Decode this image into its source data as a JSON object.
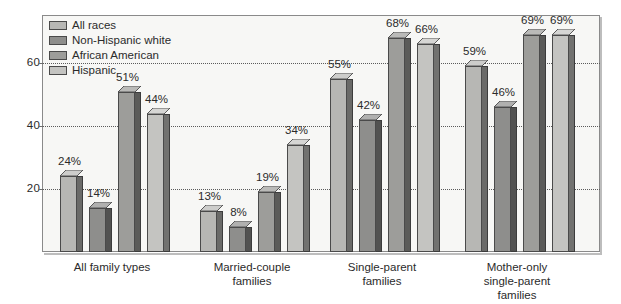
{
  "chart_data": {
    "type": "bar",
    "title": "",
    "subtitle": "",
    "xlabel": "",
    "ylabel": "",
    "ylim": [
      0,
      75
    ],
    "yticks": [
      20,
      40,
      60
    ],
    "ytick_labels": [
      "20",
      "40",
      "60"
    ],
    "grid": true,
    "grid_style": "dotted-horizontal",
    "legend_position": "top-left-inside",
    "value_suffix": "%",
    "categories": [
      "All family types",
      "Married-couple\nfamilies",
      "Single-parent\nfamilies",
      "Mother-only\nsingle-parent\nfamilies"
    ],
    "series": [
      {
        "name": "All races",
        "color": "#b7b7b4",
        "values": [
          24,
          13,
          55,
          59
        ],
        "labels": [
          "24%",
          "13%",
          "55%",
          "59%"
        ]
      },
      {
        "name": "Non-Hispanic white",
        "color": "#8e8e8c",
        "values": [
          14,
          8,
          42,
          46
        ],
        "labels": [
          "14%",
          "8%",
          "42%",
          "46%"
        ]
      },
      {
        "name": "African American",
        "color": "#9d9d9a",
        "values": [
          51,
          19,
          68,
          69
        ],
        "labels": [
          "51%",
          "19%",
          "68%",
          "69%"
        ]
      },
      {
        "name": "Hispanic",
        "color": "#c4c4c1",
        "values": [
          44,
          34,
          66,
          69
        ],
        "labels": [
          "44%",
          "34%",
          "66%",
          "69%"
        ]
      }
    ]
  },
  "legend": {
    "items": [
      {
        "label": "All races"
      },
      {
        "label": "Non-Hispanic white"
      },
      {
        "label": "African American"
      },
      {
        "label": "Hispanic"
      }
    ]
  },
  "axis": {
    "y_tick_labels": [
      "60",
      "40",
      "20"
    ]
  },
  "categories": [
    {
      "label": "All family types"
    },
    {
      "label": "Married-couple\nfamilies"
    },
    {
      "label": "Single-parent\nfamilies"
    },
    {
      "label": "Mother-only\nsingle-parent\nfamilies"
    }
  ]
}
